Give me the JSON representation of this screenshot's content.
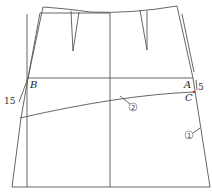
{
  "diagram": {
    "type": "skirt-pattern-draft",
    "line_color": "#555555",
    "accent_color": "#c0392b",
    "points": {
      "A": {
        "label": "A"
      },
      "B": {
        "label": "B"
      },
      "C": {
        "label": "C"
      }
    },
    "measurements": {
      "left_offset": "15",
      "right_offset": "5"
    },
    "markers": {
      "m1": "①",
      "m2": "②"
    }
  }
}
